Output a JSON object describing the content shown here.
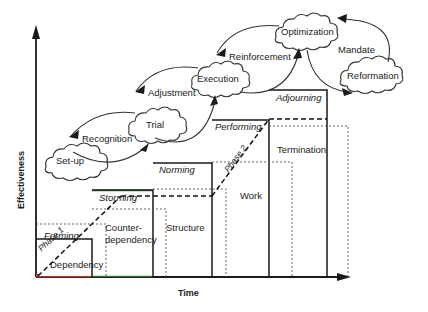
{
  "diagram": {
    "axes": {
      "y_label": "Effectiveness",
      "x_label": "Time",
      "axis_color": "#1a1a1a"
    },
    "colors": {
      "solid_line": "#1a1a1a",
      "dotted_line": "#555555",
      "dashed_phase": "#111111",
      "accent_green": "#2e7d32",
      "accent_red": "#c0392b",
      "cloud_stroke": "#333333",
      "text": "#1a1a1a"
    },
    "stage_boxes": [
      {
        "id": "forming",
        "stage": "Forming",
        "behavior": "Dependency"
      },
      {
        "id": "storming",
        "stage": "Storming",
        "behavior": "Counter-dependency"
      },
      {
        "id": "norming",
        "stage": "Norming",
        "behavior": "Structure"
      },
      {
        "id": "performing",
        "stage": "Performing",
        "behavior": "Work"
      },
      {
        "id": "adjourning",
        "stage": "Adjourning",
        "behavior": "Termination"
      }
    ],
    "behavior_lines": {
      "counter_dependency_line1": "Counter-",
      "counter_dependency_line2": "dependency"
    },
    "phases": [
      {
        "id": "phase-1",
        "label": "Phase 1"
      },
      {
        "id": "phase-2",
        "label": "Phase 2"
      }
    ],
    "clouds": [
      {
        "id": "set-up",
        "label": "Set-up"
      },
      {
        "id": "trial",
        "label": "Trial"
      },
      {
        "id": "execution",
        "label": "Execution"
      },
      {
        "id": "optimization",
        "label": "Optimization"
      },
      {
        "id": "reformation",
        "label": "Reformation"
      }
    ],
    "transitions": [
      {
        "id": "recognition",
        "label": "Recognition"
      },
      {
        "id": "adjustment",
        "label": "Adjustment"
      },
      {
        "id": "reinforcement",
        "label": "Reinforcement"
      },
      {
        "id": "mandate",
        "label": "Mandate"
      }
    ]
  }
}
